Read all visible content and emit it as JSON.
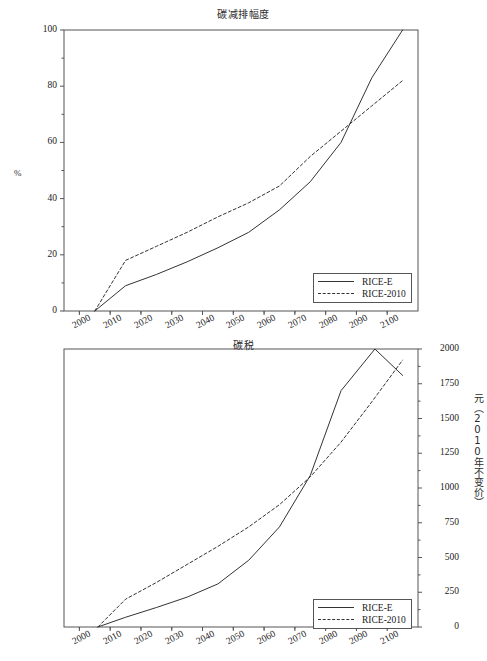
{
  "chart_data": [
    {
      "id": "emission-reduction",
      "type": "line",
      "title": "碳减排幅度",
      "xlabel": "",
      "ylabel": "%",
      "ylabel_side": "left",
      "xlim": [
        1995,
        2110
      ],
      "ylim": [
        0,
        100
      ],
      "yticks": [
        0,
        20,
        40,
        60,
        80,
        100
      ],
      "xticks": [
        2000,
        2010,
        2020,
        2030,
        2040,
        2050,
        2060,
        2070,
        2080,
        2090,
        2100
      ],
      "grid": false,
      "legend_position": "bottom-right",
      "series": [
        {
          "name": "RICE-E",
          "style": "solid",
          "x": [
            2005,
            2015,
            2025,
            2035,
            2045,
            2055,
            2065,
            2075,
            2085,
            2095,
            2105
          ],
          "values": [
            0,
            9,
            13,
            17.5,
            22.5,
            28,
            36,
            46,
            60,
            83,
            100
          ]
        },
        {
          "name": "RICE-2010",
          "style": "dashed",
          "x": [
            2005,
            2015,
            2025,
            2035,
            2045,
            2055,
            2065,
            2075,
            2085,
            2095,
            2105
          ],
          "values": [
            0,
            18,
            23,
            28,
            33.5,
            38.5,
            44.5,
            55,
            64,
            73,
            82
          ]
        }
      ]
    },
    {
      "id": "carbon-tax",
      "type": "line",
      "title": "碳税",
      "xlabel": "",
      "ylabel": "元（2010年不变价）",
      "ylabel_side": "right",
      "xlim": [
        1995,
        2110
      ],
      "ylim": [
        0,
        2000
      ],
      "yticks": [
        0,
        250,
        500,
        750,
        1000,
        1250,
        1500,
        1750,
        2000
      ],
      "xticks": [
        2000,
        2010,
        2020,
        2030,
        2040,
        2050,
        2060,
        2070,
        2080,
        2090,
        2100
      ],
      "grid": false,
      "legend_position": "bottom-right",
      "series": [
        {
          "name": "RICE-E",
          "style": "solid",
          "x": [
            2006,
            2015,
            2025,
            2035,
            2045,
            2055,
            2065,
            2075,
            2085,
            2096,
            2105
          ],
          "values": [
            0,
            70,
            140,
            215,
            310,
            480,
            720,
            1090,
            1700,
            2000,
            1810
          ]
        },
        {
          "name": "RICE-2010",
          "style": "dashed",
          "x": [
            2006,
            2015,
            2025,
            2035,
            2045,
            2055,
            2065,
            2075,
            2085,
            2095,
            2105
          ],
          "values": [
            0,
            200,
            320,
            450,
            580,
            720,
            880,
            1080,
            1330,
            1620,
            1920
          ]
        }
      ]
    }
  ],
  "emission": {
    "title": "碳减排幅度",
    "ylabel": "%",
    "yticks": [
      "0",
      "20",
      "40",
      "60",
      "80",
      "100"
    ],
    "xticks": [
      "2000",
      "2010",
      "2020",
      "2030",
      "2040",
      "2050",
      "2060",
      "2070",
      "2080",
      "2090",
      "2100"
    ],
    "legend": [
      {
        "label": "RICE-E",
        "style": "solid"
      },
      {
        "label": "RICE-2010",
        "style": "dashed"
      }
    ]
  },
  "tax": {
    "title": "碳税",
    "ylabel": "元（2010年不变价）",
    "yticks": [
      "0",
      "250",
      "500",
      "750",
      "1000",
      "1250",
      "1500",
      "1750",
      "2000"
    ],
    "xticks": [
      "2000",
      "2010",
      "2020",
      "2030",
      "2040",
      "2050",
      "2060",
      "2070",
      "2080",
      "2090",
      "2100"
    ],
    "legend": [
      {
        "label": "RICE-E",
        "style": "solid"
      },
      {
        "label": "RICE-2010",
        "style": "dashed"
      }
    ]
  },
  "colors": {
    "line": "#333333",
    "axis": "#555555",
    "text": "#1a1a1a"
  }
}
